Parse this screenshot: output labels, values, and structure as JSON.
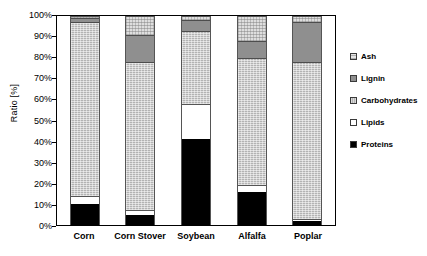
{
  "chart_data": {
    "type": "bar",
    "subtype": "stacked-percentage",
    "title": "",
    "xlabel": "",
    "ylabel": "Ratio [%]",
    "ylim": [
      0,
      100
    ],
    "ytick_labels": [
      "100%",
      "90%",
      "80%",
      "70%",
      "60%",
      "50%",
      "40%",
      "30%",
      "20%",
      "10%",
      "0%"
    ],
    "ytick_values": [
      100,
      90,
      80,
      70,
      60,
      50,
      40,
      30,
      20,
      10,
      0
    ],
    "grid": false,
    "legend_position": "right",
    "categories": [
      "Corn",
      "Corn Stover",
      "Soybean",
      "Alfalfa",
      "Poplar"
    ],
    "series": [
      {
        "name": "Proteins",
        "values": [
          10,
          5,
          41,
          16,
          2
        ]
      },
      {
        "name": "Lipids",
        "values": [
          4,
          2,
          17,
          3,
          1
        ]
      },
      {
        "name": "Carbohydrates",
        "values": [
          83,
          71,
          35,
          61,
          75
        ]
      },
      {
        "name": "Lignin",
        "values": [
          2,
          13,
          5,
          8,
          19
        ]
      },
      {
        "name": "Ash",
        "values": [
          1,
          9,
          2,
          12,
          3
        ]
      }
    ],
    "legend_entries": [
      "Ash",
      "Lignin",
      "Carbohydrates",
      "Lipids",
      "Proteins"
    ],
    "colors": {
      "Ash": "#dedede",
      "Lignin": "#8f8f8f",
      "Carbohydrates": "#b3b3b3",
      "Lipids": "#ffffff",
      "Proteins": "#000000"
    }
  }
}
